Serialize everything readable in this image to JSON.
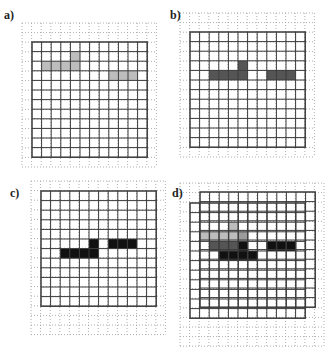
{
  "figure": {
    "grid_size": 12,
    "colors": {
      "frame": "#3a3a3a",
      "dotted": "#9a9a9a",
      "light_gray": "#bdbdbd",
      "mid_gray": "#9c9c9c",
      "dark_gray": "#555555",
      "black": "#111111"
    },
    "panels": [
      {
        "label": "a)",
        "label_pos": [
          4,
          20
        ],
        "frames": [
          {
            "x": 32,
            "y": 42,
            "cell": 9.6
          }
        ],
        "dotted": {
          "x": 22,
          "y": 23,
          "cols": 14,
          "rows": 15,
          "cell": 9.6
        },
        "cells": [
          {
            "frame": 0,
            "row": 1,
            "col": 4,
            "shade": "light_gray"
          },
          {
            "frame": 0,
            "row": 2,
            "col": 1,
            "shade": "light_gray"
          },
          {
            "frame": 0,
            "row": 2,
            "col": 2,
            "shade": "light_gray"
          },
          {
            "frame": 0,
            "row": 2,
            "col": 3,
            "shade": "light_gray"
          },
          {
            "frame": 0,
            "row": 2,
            "col": 4,
            "shade": "light_gray"
          },
          {
            "frame": 0,
            "row": 3,
            "col": 8,
            "shade": "light_gray"
          },
          {
            "frame": 0,
            "row": 3,
            "col": 9,
            "shade": "light_gray"
          },
          {
            "frame": 0,
            "row": 3,
            "col": 10,
            "shade": "light_gray"
          }
        ]
      },
      {
        "label": "b)",
        "label_pos": [
          170,
          20
        ],
        "frames": [
          {
            "x": 190,
            "y": 32,
            "cell": 9.6
          }
        ],
        "dotted": {
          "x": 180,
          "y": 13,
          "cols": 14,
          "rows": 15,
          "cell": 9.6
        },
        "cells": [
          {
            "frame": 0,
            "row": 3,
            "col": 5,
            "shade": "dark_gray"
          },
          {
            "frame": 0,
            "row": 4,
            "col": 2,
            "shade": "dark_gray"
          },
          {
            "frame": 0,
            "row": 4,
            "col": 3,
            "shade": "dark_gray"
          },
          {
            "frame": 0,
            "row": 4,
            "col": 4,
            "shade": "dark_gray"
          },
          {
            "frame": 0,
            "row": 4,
            "col": 5,
            "shade": "dark_gray"
          },
          {
            "frame": 0,
            "row": 4,
            "col": 8,
            "shade": "dark_gray"
          },
          {
            "frame": 0,
            "row": 4,
            "col": 9,
            "shade": "dark_gray"
          },
          {
            "frame": 0,
            "row": 4,
            "col": 10,
            "shade": "dark_gray"
          }
        ]
      },
      {
        "label": "c)",
        "label_pos": [
          10,
          198
        ],
        "frames": [
          {
            "x": 41,
            "y": 191,
            "cell": 9.6
          }
        ],
        "dotted": {
          "x": 31,
          "y": 181,
          "cols": 14,
          "rows": 16,
          "cell": 9.6
        },
        "cells": [
          {
            "frame": 0,
            "row": 5,
            "col": 5,
            "shade": "black"
          },
          {
            "frame": 0,
            "row": 5,
            "col": 7,
            "shade": "black"
          },
          {
            "frame": 0,
            "row": 5,
            "col": 8,
            "shade": "black"
          },
          {
            "frame": 0,
            "row": 5,
            "col": 9,
            "shade": "black"
          },
          {
            "frame": 0,
            "row": 6,
            "col": 2,
            "shade": "black"
          },
          {
            "frame": 0,
            "row": 6,
            "col": 3,
            "shade": "black"
          },
          {
            "frame": 0,
            "row": 6,
            "col": 4,
            "shade": "black"
          },
          {
            "frame": 0,
            "row": 6,
            "col": 5,
            "shade": "black"
          }
        ]
      },
      {
        "label": "d)",
        "label_pos": [
          172,
          198
        ],
        "frames": [
          {
            "x": 200,
            "y": 192,
            "cell": 9.6
          },
          {
            "x": 190,
            "y": 203,
            "cell": 9.6
          }
        ],
        "dotted": {
          "x": 180,
          "y": 183,
          "cols": 15,
          "rows": 17,
          "cell": 9.6
        },
        "cells": [
          {
            "frame": 1,
            "row": 2,
            "col": 4,
            "shade": "light_gray"
          },
          {
            "frame": 1,
            "row": 3,
            "col": 1,
            "shade": "light_gray"
          },
          {
            "frame": 1,
            "row": 3,
            "col": 2,
            "shade": "light_gray"
          },
          {
            "frame": 1,
            "row": 3,
            "col": 3,
            "shade": "light_gray"
          },
          {
            "frame": 1,
            "row": 3,
            "col": 4,
            "shade": "light_gray"
          },
          {
            "frame": 1,
            "row": 3,
            "col": 5,
            "shade": "mid_gray"
          },
          {
            "frame": 1,
            "row": 4,
            "col": 2,
            "shade": "dark_gray"
          },
          {
            "frame": 1,
            "row": 4,
            "col": 3,
            "shade": "dark_gray"
          },
          {
            "frame": 1,
            "row": 4,
            "col": 4,
            "shade": "dark_gray"
          },
          {
            "frame": 1,
            "row": 4,
            "col": 5,
            "shade": "black"
          },
          {
            "frame": 1,
            "row": 4,
            "col": 8,
            "shade": "black"
          },
          {
            "frame": 1,
            "row": 4,
            "col": 9,
            "shade": "black"
          },
          {
            "frame": 1,
            "row": 4,
            "col": 10,
            "shade": "black"
          },
          {
            "frame": 1,
            "row": 5,
            "col": 3,
            "shade": "black"
          },
          {
            "frame": 1,
            "row": 5,
            "col": 4,
            "shade": "black"
          },
          {
            "frame": 1,
            "row": 5,
            "col": 5,
            "shade": "black"
          },
          {
            "frame": 1,
            "row": 5,
            "col": 6,
            "shade": "black"
          }
        ]
      }
    ]
  }
}
